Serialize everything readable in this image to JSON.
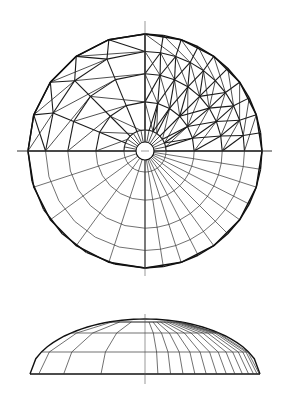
{
  "figure": {
    "line_color": "#111111",
    "background": "#ffffff"
  },
  "plan_view": {
    "center": [
      145,
      151
    ],
    "radius": 117,
    "rim_segments": 20,
    "oculus_radius": 9,
    "axis_horizontal": {
      "x1": 17,
      "x2": 272,
      "y": 151
    },
    "axis_vertical": {
      "x": 145,
      "y1": 21,
      "y2": 276
    },
    "upper_half": {
      "style": "triangulated geodesic struts",
      "ring_fractions": [
        0.18,
        0.42,
        0.66,
        0.85,
        1.0
      ],
      "left_quarter_divisions": [
        8,
        4,
        4,
        4,
        5
      ],
      "right_quarter_divisions": [
        8,
        6,
        8,
        10,
        10
      ]
    },
    "lower_half": {
      "style": "radial polar grid",
      "ring_fractions": [
        0.18,
        0.42,
        0.66,
        0.85,
        1.0
      ],
      "left_quarter_spokes": 5,
      "right_quarter_spokes": 10
    }
  },
  "elevation_view": {
    "base_y": 374,
    "apex_y": 319,
    "center_x": 145,
    "half_width": 115,
    "ring_levels_y": [
      333,
      352
    ],
    "axis_vertical": {
      "x": 145,
      "y1": 314,
      "y2": 384
    },
    "left_meridians": 4,
    "right_meridians": 14
  }
}
